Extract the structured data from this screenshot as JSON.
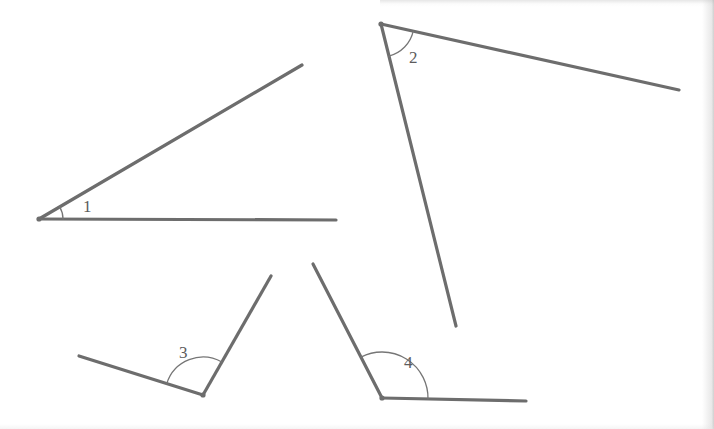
{
  "page": {
    "background_color": "#ffffff",
    "width": 714,
    "height": 429
  },
  "style": {
    "stroke_color": "#6d6d6d",
    "arc_color": "#767676",
    "label_color": "#5c5c5c",
    "ray_width": 3.2,
    "arc_width": 1.3,
    "vertex_dot_radius": 2.6
  },
  "figure": {
    "kind": "line-drawing",
    "angles": [
      {
        "id": "angle-1",
        "label": "1",
        "label_x": 83,
        "label_y": 212,
        "vertex": {
          "x": 39,
          "y": 219
        },
        "rays": [
          {
            "name": "upper-ray",
            "to_x": 302,
            "to_y": 65
          },
          {
            "name": "horizontal-ray",
            "to_x": 336,
            "to_y": 220
          }
        ],
        "arc": {
          "radius": 24,
          "start_deg": 359,
          "end_deg": 330
        },
        "measure_estimate_deg": 30
      },
      {
        "id": "angle-2",
        "label": "2",
        "label_x": 409,
        "label_y": 63,
        "vertex": {
          "x": 381,
          "y": 24
        },
        "rays": [
          {
            "name": "right-ray",
            "to_x": 679,
            "to_y": 90
          },
          {
            "name": "down-ray",
            "to_x": 456,
            "to_y": 326
          }
        ],
        "arc": {
          "radius": 33,
          "start_deg": 12,
          "end_deg": 77
        },
        "measure_estimate_deg": 65
      },
      {
        "id": "angle-3",
        "label": "3",
        "label_x": 179,
        "label_y": 358,
        "vertex": {
          "x": 203,
          "y": 395
        },
        "rays": [
          {
            "name": "left-ray",
            "to_x": 79,
            "to_y": 356
          },
          {
            "name": "upper-right-ray",
            "to_x": 271,
            "to_y": 276
          }
        ],
        "arc": {
          "radius": 38,
          "start_deg": 197,
          "end_deg": 300
        },
        "measure_estimate_deg": 103
      },
      {
        "id": "angle-4",
        "label": "4",
        "label_x": 404,
        "label_y": 368,
        "vertex": {
          "x": 382,
          "y": 398
        },
        "rays": [
          {
            "name": "upper-left-ray",
            "to_x": 313,
            "to_y": 264
          },
          {
            "name": "horizontal-right-ray",
            "to_x": 526,
            "to_y": 401
          }
        ],
        "arc": {
          "radius": 46,
          "start_deg": 1,
          "end_deg": 243
        },
        "measure_estimate_deg": 117
      }
    ]
  }
}
